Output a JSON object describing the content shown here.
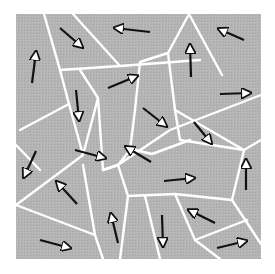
{
  "diagram": {
    "type": "grain-domain-diagram",
    "background_color": "#ffffff",
    "region_fill": "#b4b4b4",
    "boundary_color": "#ffffff",
    "arrow_color": "#111111",
    "arrow_head_fill": "#ffffff",
    "frame": {
      "x": 16,
      "y": 14,
      "w": 245,
      "h": 245
    },
    "boundaries": [
      "M44 14 L60 70 L69 104 L20 130",
      "M60 70 L120 66 L200 60",
      "M73 14 L120 66",
      "M69 104 L83 155 L98 98 L80 70",
      "M98 98 L103 170 L118 165",
      "M83 155 L16 205",
      "M103 170 L118 165 L170 130 L261 95",
      "M135 150 L152 154 L190 140",
      "M189 14 L168 53 L175 110 L180 140",
      "M189 14 L222 75",
      "M168 53 L140 62 L135 110",
      "M135 110 L130 150 L118 165",
      "M16 205 L95 235 L103 259",
      "M95 235 L83 165",
      "M16 145 L40 170",
      "M118 165 L128 196 L175 194 L232 200",
      "M128 196 L120 259",
      "M175 194 L195 240 L220 259",
      "M232 200 L261 244",
      "M232 200 L244 150 L261 140",
      "M195 240 L247 220",
      "M145 196 L160 259",
      "M180 140 L244 150",
      "M175 110 L244 150"
    ],
    "arrows": [
      {
        "x1": 32,
        "y1": 83,
        "x2": 36,
        "y2": 52
      },
      {
        "x1": 60,
        "y1": 28,
        "x2": 82,
        "y2": 47
      },
      {
        "x1": 150,
        "y1": 32,
        "x2": 115,
        "y2": 28
      },
      {
        "x1": 108,
        "y1": 88,
        "x2": 137,
        "y2": 76
      },
      {
        "x1": 76,
        "y1": 90,
        "x2": 79,
        "y2": 120
      },
      {
        "x1": 191,
        "y1": 77,
        "x2": 190,
        "y2": 45
      },
      {
        "x1": 244,
        "y1": 40,
        "x2": 219,
        "y2": 29
      },
      {
        "x1": 220,
        "y1": 94,
        "x2": 250,
        "y2": 93
      },
      {
        "x1": 143,
        "y1": 108,
        "x2": 166,
        "y2": 126
      },
      {
        "x1": 194,
        "y1": 122,
        "x2": 211,
        "y2": 143
      },
      {
        "x1": 75,
        "y1": 150,
        "x2": 105,
        "y2": 158
      },
      {
        "x1": 151,
        "y1": 162,
        "x2": 126,
        "y2": 147
      },
      {
        "x1": 164,
        "y1": 181,
        "x2": 194,
        "y2": 178
      },
      {
        "x1": 246,
        "y1": 190,
        "x2": 246,
        "y2": 160
      },
      {
        "x1": 36,
        "y1": 151,
        "x2": 24,
        "y2": 177
      },
      {
        "x1": 77,
        "y1": 204,
        "x2": 57,
        "y2": 182
      },
      {
        "x1": 118,
        "y1": 243,
        "x2": 111,
        "y2": 214
      },
      {
        "x1": 40,
        "y1": 240,
        "x2": 70,
        "y2": 248
      },
      {
        "x1": 162,
        "y1": 215,
        "x2": 163,
        "y2": 246
      },
      {
        "x1": 215,
        "y1": 223,
        "x2": 189,
        "y2": 210
      },
      {
        "x1": 217,
        "y1": 248,
        "x2": 246,
        "y2": 241
      }
    ]
  }
}
